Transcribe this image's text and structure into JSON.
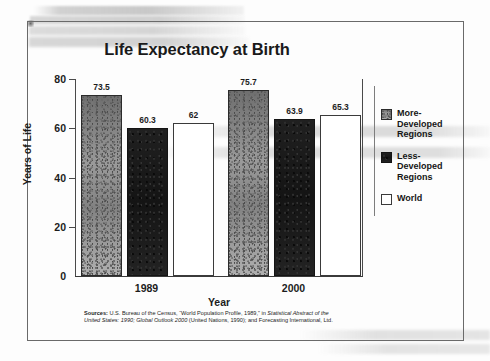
{
  "chart_data": {
    "type": "bar",
    "title": "Life Expectancy at Birth",
    "xlabel": "Year",
    "ylabel": "Years of Life",
    "categories": [
      "1989",
      "2000"
    ],
    "ylim": [
      0,
      80
    ],
    "yticks": [
      "0",
      "20",
      "40",
      "60",
      "80"
    ],
    "grid": false,
    "legend_position": "right",
    "series": [
      {
        "name": "More-\nDeveloped\nRegions",
        "legend_label": "More-\nDeveloped\nRegions",
        "swatch": "gray-textured",
        "values": [
          73.5,
          75.7
        ],
        "labels": [
          "73.5",
          "75.7"
        ]
      },
      {
        "name": "Less-\nDeveloped\nRegions",
        "legend_label": "Less-\nDeveloped\nRegions",
        "swatch": "black",
        "values": [
          60.3,
          63.9
        ],
        "labels": [
          "60.3",
          "63.9"
        ]
      },
      {
        "name": "World",
        "legend_label": "World",
        "swatch": "white",
        "values": [
          62,
          65.3
        ],
        "labels": [
          "62",
          "65.3"
        ]
      }
    ]
  },
  "source": {
    "label": "Sources:",
    "line1_plain_a": " U.S. Bureau of the Census, “World Population Profile, 1989,” in ",
    "line1_italic": "Statistical Abstract of the",
    "line2_italic": "United States: 1990; Global Outlook 2000",
    "line2_plain": " (United Nations, 1990); and Forecasting International, Ltd."
  },
  "colors": {
    "more_developed": "#8d8d8d",
    "less_developed": "#1b1b1b",
    "world": "#ffffff",
    "frame": "#6a6a6a",
    "text": "#1c1c1c"
  }
}
